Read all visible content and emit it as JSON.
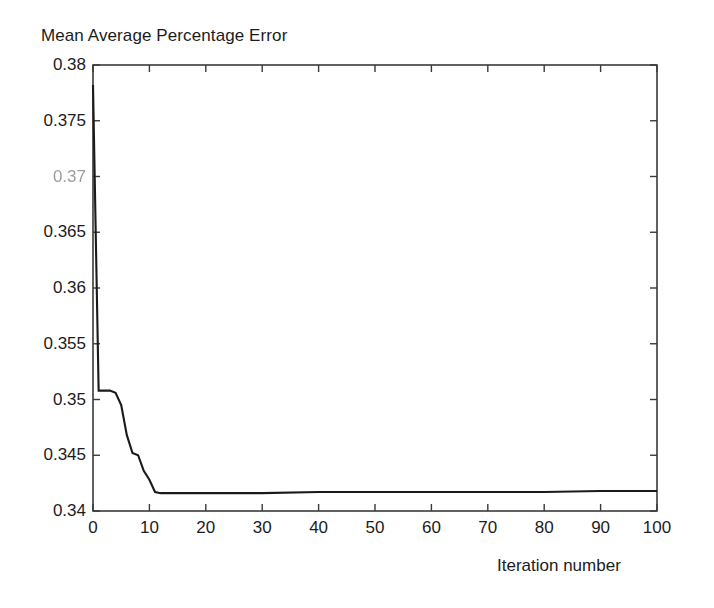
{
  "chart_data": {
    "type": "line",
    "title": "Mean Average Percentage Error",
    "xlabel": "Iteration number",
    "ylabel": "",
    "xlim": [
      0,
      100
    ],
    "ylim": [
      0.34,
      0.38
    ],
    "grid": false,
    "legend": null,
    "xticks": [
      "0",
      "10",
      "20",
      "30",
      "40",
      "50",
      "60",
      "70",
      "80",
      "90",
      "100"
    ],
    "xtick_values": [
      0,
      10,
      20,
      30,
      40,
      50,
      60,
      70,
      80,
      90,
      100
    ],
    "yticks": [
      "0.38",
      "0.375",
      "0.37",
      "0.365",
      "0.36",
      "0.355",
      "0.35",
      "0.345",
      "0.34"
    ],
    "ytick_values": [
      0.38,
      0.375,
      0.37,
      0.365,
      0.36,
      0.355,
      0.35,
      0.345,
      0.34
    ],
    "line_color": "#1a1a1a",
    "axis_color": "#3a3a3a",
    "background": "#ffffff",
    "series": [
      {
        "name": "MAPE",
        "x": [
          0,
          1,
          2,
          3,
          4,
          5,
          6,
          7,
          8,
          9,
          10,
          11,
          12,
          20,
          30,
          40,
          50,
          60,
          70,
          80,
          90,
          100
        ],
        "values": [
          0.3782,
          0.3508,
          0.3508,
          0.3508,
          0.3506,
          0.3495,
          0.3468,
          0.3452,
          0.345,
          0.3436,
          0.3428,
          0.3417,
          0.3416,
          0.3416,
          0.3416,
          0.3417,
          0.3417,
          0.3417,
          0.3417,
          0.3417,
          0.3418,
          0.3418
        ]
      }
    ]
  },
  "axis_geometry": {
    "left": 93,
    "right": 657,
    "top": 65,
    "bottom": 511
  }
}
